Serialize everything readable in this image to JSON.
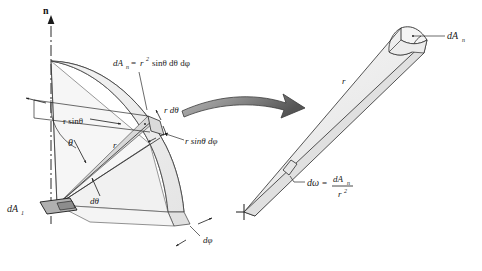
{
  "figure": {
    "axis_label": "n",
    "labels": {
      "dA1": "dA",
      "dA1_sub": "1",
      "dAn_formula_lhs": "dA",
      "dAn_formula_lhs_sub": "n",
      "dAn_formula_eq": "=",
      "dAn_formula_r": "r",
      "dAn_formula_r_sup": "2",
      "dAn_formula_rest": "sinθ  dθ dφ",
      "r_sin_theta": "r sinθ",
      "r_sin_theta_dphi": "r sinθ dφ",
      "r_dtheta": "r dθ",
      "theta": "θ",
      "dtheta": "dθ",
      "dphi": "dφ",
      "radius": "r",
      "dAn_right": "dA",
      "dAn_right_sub": "n",
      "domega": "dω",
      "domega_eq": "=",
      "domega_num": "dA",
      "domega_num_sub": "n",
      "domega_den": "r",
      "domega_den_sup": "2",
      "radius_right": "r"
    },
    "colors": {
      "stroke": "#1a1a1a",
      "line": "#2b2b2b",
      "fill_light": "#f2f2f2",
      "fill_mid": "#e3e3e3",
      "fill_dark": "#c9c9c9",
      "fill_patch": "#a8a8a8",
      "arrow_dark": "#4d4d4d",
      "arrow_light": "#b5b5b5",
      "background": "#ffffff"
    }
  }
}
